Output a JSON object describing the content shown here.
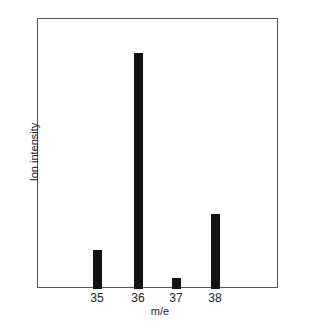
{
  "chart_data": {
    "type": "bar",
    "title": "",
    "xlabel": "m/e",
    "ylabel": "Ion intensity",
    "categories": [
      "35",
      "36",
      "37",
      "38"
    ],
    "values": [
      16.5,
      100,
      4.7,
      31.8
    ],
    "ylim": [
      0,
      114
    ],
    "grid": false,
    "legend": null,
    "value_units": "relative intensity (m/e 36 = 100)"
  },
  "layout": {
    "plot_left": 38,
    "plot_right": 278,
    "plot_top": 19,
    "plot_bottom": 289,
    "bar_centers": [
      97,
      138,
      176,
      215
    ],
    "bar_width": 9,
    "px_per_unit": 2.36
  }
}
